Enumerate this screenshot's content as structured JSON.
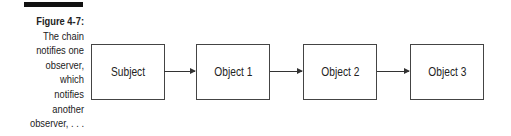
{
  "caption": {
    "title": "Figure 4-7:",
    "lines": [
      "The chain",
      "notifies one",
      "observer,",
      "which",
      "notifies",
      "another",
      "observer, . . ."
    ]
  },
  "diagram": {
    "nodes": [
      {
        "label": "Subject"
      },
      {
        "label": "Object 1"
      },
      {
        "label": "Object 2"
      },
      {
        "label": "Object 3"
      }
    ],
    "edges": [
      {
        "from": "Subject",
        "to": "Object 1"
      },
      {
        "from": "Object 1",
        "to": "Object 2"
      },
      {
        "from": "Object 2",
        "to": "Object 3"
      }
    ]
  }
}
